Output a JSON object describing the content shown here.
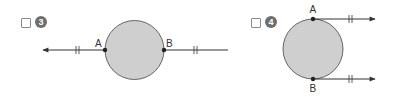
{
  "options": [
    {
      "number": "3",
      "label_a": "A",
      "label_b": "B",
      "description": "Circle with line through A and B, arrow to the left"
    },
    {
      "number": "4",
      "label_a": "A",
      "label_b": "B",
      "description": "Circle with parallel tangent rays from A (top) and B (bottom) pointing right"
    }
  ],
  "colors": {
    "circle_fill": "#cfcfcf",
    "stroke": "#333333",
    "badge": "#6e6e6e"
  }
}
